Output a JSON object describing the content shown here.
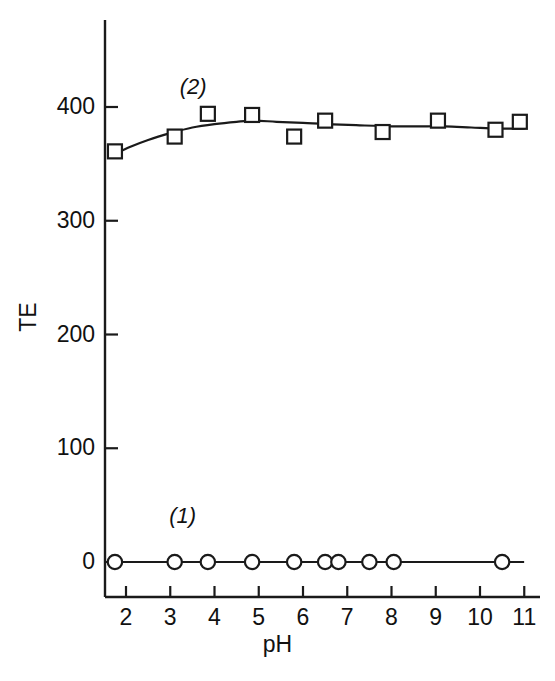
{
  "figure": {
    "background_color": "#ffffff",
    "ink_color": "#1a1a1a",
    "width": 555,
    "height": 681
  },
  "axes": {
    "x_title": "pH",
    "y_title": "TE",
    "x_ticks": [
      "2",
      "3",
      "4",
      "5",
      "6",
      "7",
      "8",
      "9",
      "10",
      "11"
    ],
    "y_ticks": [
      "0",
      "100",
      "200",
      "300",
      "400"
    ]
  },
  "annotations": {
    "series1_label": "(1)",
    "series2_label": "(2)"
  },
  "chart_data": {
    "type": "scatter",
    "title": "",
    "subtitle": "",
    "xlabel": "pH",
    "ylabel": "TE",
    "xlim": [
      1.55,
      11.25
    ],
    "ylim": [
      -30,
      440
    ],
    "x_ticks": [
      2,
      3,
      4,
      5,
      6,
      7,
      8,
      9,
      10,
      11
    ],
    "y_ticks": [
      0,
      100,
      200,
      300,
      400
    ],
    "grid": false,
    "legend": "inline-annotations",
    "legend_position": "inline",
    "series": [
      {
        "name": "(1)",
        "marker": "open-circle",
        "line": "solid",
        "annotation": "(1)",
        "annotation_x": 3.28,
        "annotation_y": 40,
        "x": [
          1.75,
          3.1,
          3.85,
          4.85,
          5.8,
          6.5,
          6.8,
          7.5,
          8.05,
          10.5
        ],
        "y": [
          0,
          0,
          0,
          0,
          0,
          0,
          0,
          0,
          0,
          0
        ]
      },
      {
        "name": "(2)",
        "marker": "open-square",
        "line": "solid",
        "annotation": "(2)",
        "annotation_x": 3.52,
        "annotation_y": 417,
        "x": [
          1.75,
          3.1,
          3.85,
          4.85,
          5.8,
          6.5,
          7.8,
          9.05,
          10.35,
          10.9
        ],
        "y": [
          361,
          374,
          394,
          393,
          374,
          388,
          378,
          388,
          380,
          387
        ],
        "fit_curve": [
          [
            1.72,
            358
          ],
          [
            2.1,
            365
          ],
          [
            2.5,
            371
          ],
          [
            3.0,
            377
          ],
          [
            3.5,
            382
          ],
          [
            4.0,
            385
          ],
          [
            4.5,
            387
          ],
          [
            4.9,
            388
          ],
          [
            5.4,
            387
          ],
          [
            6.0,
            386
          ],
          [
            6.5,
            385
          ],
          [
            7.2,
            384
          ],
          [
            8.0,
            383
          ],
          [
            8.6,
            383
          ],
          [
            9.2,
            383
          ],
          [
            9.8,
            382
          ],
          [
            10.4,
            381
          ],
          [
            11.0,
            381
          ]
        ]
      }
    ]
  }
}
